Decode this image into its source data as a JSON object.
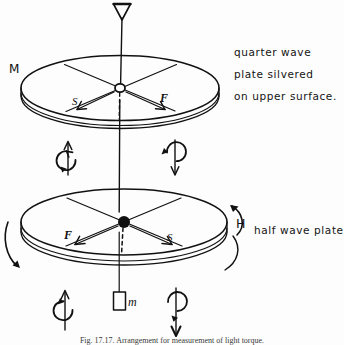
{
  "figure": {
    "title_caption": "Fig. 17.17.  Arrangement for measurement of light torque.",
    "background_color": "#fdfdfd",
    "ink_color": "#111111"
  },
  "labels": {
    "mirror_M": "M",
    "field_H": "H",
    "mass_m": "m",
    "upper_slow_axis": "S",
    "upper_fast_axis": "F",
    "lower_fast_axis": "F",
    "lower_slow_axis": "S"
  },
  "annotations": {
    "quarter_wave_note": [
      "quarter wave",
      "plate silvered",
      "on upper surface."
    ],
    "half_wave_note": "half wave plate"
  },
  "icons": {
    "top_pointer": "triangle-pointer-icon",
    "upper_disk": "quarter-wave-plate-disk",
    "lower_disk": "half-wave-plate-disk",
    "hanging_mass": "mass-block-icon",
    "spin_up_left": "spin-arrow-up-ccw-icon",
    "spin_down_right": "spin-arrow-down-cw-icon",
    "spin_up_lower_left": "spin-arrow-up-ccw-icon",
    "spin_down_lower_right": "spin-arrow-down-cw-icon",
    "torque_arrow_left": "curved-arrow-down-icon",
    "torque_arrow_right": "curved-arrow-up-icon",
    "suspension_fiber": "vertical-fiber-line",
    "upper_pivot": "open-circle-node",
    "lower_pivot": "filled-circle-node"
  }
}
